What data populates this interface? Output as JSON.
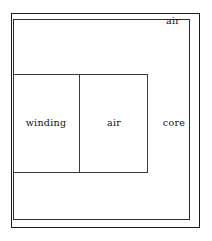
{
  "figure": {
    "background_color": "#ffffff",
    "line_color": "#1b1b1b",
    "text_color": "#111111",
    "width": 212,
    "height": 241
  },
  "regions": [
    {
      "id": "air-outer",
      "label": "air",
      "role": "outer surrounding air region",
      "x": 11,
      "y": 13,
      "width": 189,
      "height": 215,
      "stroke": "#1b1b1b"
    },
    {
      "id": "core",
      "label": "core",
      "role": "magnetic core region",
      "x": 13,
      "y": 19,
      "width": 177,
      "height": 201,
      "stroke": "#2c2c2c"
    },
    {
      "id": "window",
      "label": "",
      "role": "core window containing winding and air",
      "x": 13,
      "y": 74,
      "width": 135,
      "height": 99,
      "stroke": "#3a3a3a"
    },
    {
      "id": "winding",
      "label": "winding",
      "role": "conductor winding region",
      "x": 13,
      "y": 74,
      "width": 66,
      "height": 99,
      "stroke": "#3a3a3a"
    },
    {
      "id": "air-inner",
      "label": "air",
      "role": "air gap inside core window",
      "x": 79,
      "y": 74,
      "width": 69,
      "height": 99,
      "stroke": "#3a3a3a"
    }
  ],
  "labels": {
    "air_outer": "air",
    "winding": "winding",
    "air_inner": "air",
    "core": "core"
  }
}
